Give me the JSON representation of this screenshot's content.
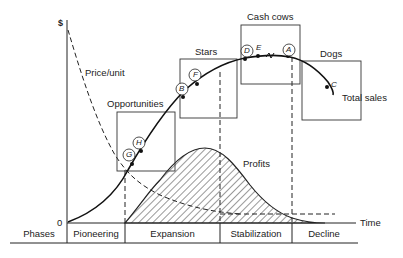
{
  "diagram": {
    "axes": {
      "y_label": "$",
      "origin_label": "0",
      "x_label": "Time"
    },
    "curves": {
      "price_per_unit": "Price/unit",
      "total_sales": "Total sales",
      "profits": "Profits"
    },
    "quadrant_boxes": [
      {
        "label": "Opportunities"
      },
      {
        "label": "Stars"
      },
      {
        "label": "Cash cows"
      },
      {
        "label": "Dogs"
      }
    ],
    "points": [
      {
        "label": "G",
        "circled": true
      },
      {
        "label": "H",
        "circled": true
      },
      {
        "label": "B",
        "circled": true
      },
      {
        "label": "F",
        "circled": true
      },
      {
        "label": "D",
        "circled": true
      },
      {
        "label": "E",
        "circled": false
      },
      {
        "label": "A",
        "circled": true
      },
      {
        "label": "C",
        "circled": false
      }
    ],
    "phases": {
      "header": "Phases",
      "items": [
        "Pioneering",
        "Expansion",
        "Stabilization",
        "Decline"
      ]
    }
  }
}
